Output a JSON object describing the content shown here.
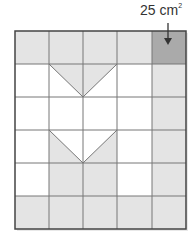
{
  "annotation": {
    "area_value": "25 cm",
    "area_exponent": "2"
  },
  "grid": {
    "columns": 5,
    "rows": 6,
    "colors": {
      "light_gray": "#e4e4e4",
      "dark_gray": "#aaaaaa",
      "white": "#ffffff",
      "line": "#555555"
    },
    "highlighted_cell": {
      "row": 0,
      "col": 4
    }
  }
}
